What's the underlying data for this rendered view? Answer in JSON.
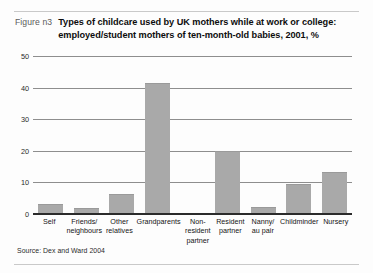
{
  "figure": {
    "label": "Figure n3",
    "title": "Types of childcare used by UK mothers while at work or college: employed/student mothers of ten-month-old babies, 2001, %",
    "source": "Source: Dex and Ward 2004"
  },
  "chart_data": {
    "type": "bar",
    "title": "Types of childcare used by UK mothers while at work or college: employed/student mothers of ten-month-old babies, 2001, %",
    "xlabel": "",
    "ylabel": "",
    "ylim": [
      0,
      50
    ],
    "yticks": [
      0,
      10,
      20,
      30,
      40,
      50
    ],
    "ytick_labels": [
      "0",
      "10",
      "20",
      "30",
      "40",
      "50"
    ],
    "grid": true,
    "legend": false,
    "bar_color": "#a9a9a9",
    "categories": [
      "Self",
      "Friends/ neighbours",
      "Other relatives",
      "Grandparents",
      "Non-resident partner",
      "Resident partner",
      "Nanny/ au pair",
      "Childminder",
      "Nursery"
    ],
    "category_lines": [
      [
        "Self",
        ""
      ],
      [
        "Friends/",
        "neighbours"
      ],
      [
        "Other",
        "relatives"
      ],
      [
        "Grandparents",
        ""
      ],
      [
        "Non-resident",
        "partner"
      ],
      [
        "Resident",
        "partner"
      ],
      [
        "Nanny/",
        "au pair"
      ],
      [
        "Childminder",
        ""
      ],
      [
        "Nursery",
        ""
      ]
    ],
    "values": [
      3.2,
      1.8,
      6.2,
      41.5,
      0.3,
      20,
      2.1,
      9.5,
      13.2
    ]
  }
}
